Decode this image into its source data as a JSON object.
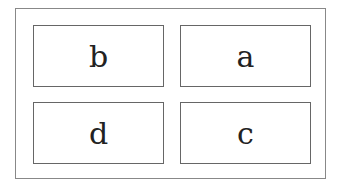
{
  "diagram": {
    "cells": [
      {
        "id": "top-left",
        "label": "b"
      },
      {
        "id": "top-right",
        "label": "a"
      },
      {
        "id": "bottom-left",
        "label": "d"
      },
      {
        "id": "bottom-right",
        "label": "c"
      }
    ]
  }
}
